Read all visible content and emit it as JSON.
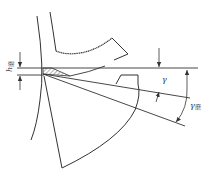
{
  "diagram": {
    "type": "cutting-tool geometry",
    "colors": {
      "line": "#333333",
      "hatch": "#444444",
      "background": "#ffffff"
    },
    "labels": {
      "h_ground": {
        "main": "h",
        "sub": "磨"
      },
      "gamma": {
        "main": "γ"
      },
      "gamma_ground": {
        "main": "γ",
        "sub": "磨"
      }
    }
  }
}
